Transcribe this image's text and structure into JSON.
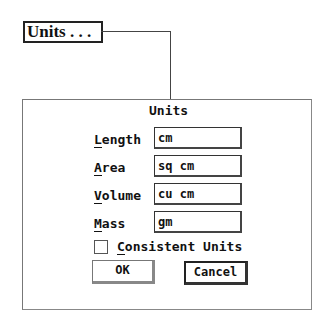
{
  "trigger_button": {
    "label": "Units . . ."
  },
  "dialog": {
    "title": "Units",
    "fields": [
      {
        "label_mnemonic": "L",
        "label_rest": "ength",
        "value": "cm"
      },
      {
        "label_mnemonic": "A",
        "label_rest": "rea",
        "value": "sq cm"
      },
      {
        "label_mnemonic": "V",
        "label_rest": "olume",
        "value": "cu cm"
      },
      {
        "label_mnemonic": "M",
        "label_rest": "ass",
        "value": "gm"
      }
    ],
    "checkbox": {
      "label_mnemonic": "C",
      "label_rest": "onsistent Units",
      "checked": "false"
    },
    "buttons": {
      "ok": "OK",
      "cancel": "Cancel"
    }
  }
}
